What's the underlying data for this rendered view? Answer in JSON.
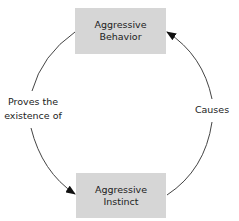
{
  "diagram": {
    "nodes": [
      {
        "id": "aggressive-behavior",
        "lines": [
          "Aggressive",
          "Behavior"
        ]
      },
      {
        "id": "aggressive-instinct",
        "lines": [
          "Aggressive",
          "Instinct"
        ]
      }
    ],
    "edges": [
      {
        "from": "aggressive-behavior",
        "to": "aggressive-instinct",
        "label_lines": [
          "Proves the",
          "existence of"
        ]
      },
      {
        "from": "aggressive-instinct",
        "to": "aggressive-behavior",
        "label_lines": [
          "Causes"
        ]
      }
    ],
    "colors": {
      "box_fill": "#d6d6d6",
      "line": "#333333",
      "text": "#222222"
    }
  }
}
